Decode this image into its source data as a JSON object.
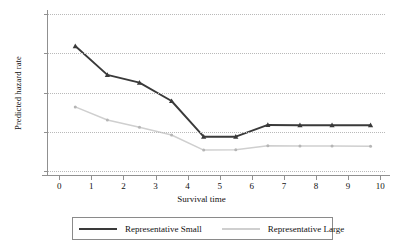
{
  "chart_data": {
    "type": "line",
    "title": "",
    "xlabel": "Survival time",
    "ylabel": "Predicted hazard rate",
    "xlim": [
      -0.35,
      10.15
    ],
    "ylim": [
      0,
      0.12
    ],
    "grid": true,
    "legend_position": "bottom",
    "xticks": [
      "0",
      "1",
      "2",
      "3",
      "4",
      "5",
      "6",
      "7",
      "8",
      "9",
      "10"
    ],
    "xtick_values": [
      0,
      1,
      2,
      3,
      4,
      5,
      6,
      7,
      8,
      9,
      10
    ],
    "yticks": [
      "",
      ".03",
      ".06",
      ".09",
      ".12"
    ],
    "ytick_values": [
      0,
      0.03,
      0.06,
      0.09,
      0.12
    ],
    "x": [
      0.5,
      1.5,
      2.5,
      3.5,
      4.5,
      5.5,
      6.5,
      7.5,
      8.5,
      9.7
    ],
    "series": [
      {
        "name": "Representative Small",
        "color": "#3a3a3a",
        "marker": "triangle",
        "values": [
          0.0955,
          0.0735,
          0.0675,
          0.0535,
          0.0262,
          0.0262,
          0.0352,
          0.035,
          0.035,
          0.035
        ]
      },
      {
        "name": "Representative Large",
        "color": "#cfcfcf",
        "marker": "dot",
        "values": [
          0.049,
          0.039,
          0.0335,
          0.0275,
          0.016,
          0.0162,
          0.0193,
          0.0191,
          0.0191,
          0.019
        ]
      }
    ]
  },
  "legend": {
    "entries": [
      {
        "label": "Representative Small"
      },
      {
        "label": "Representative Large"
      }
    ]
  },
  "colors": {
    "small_line": "#3a3a3a",
    "large_line": "#cfcfcf",
    "grid": "#b9b9b9",
    "axis": "#909090",
    "text": "#111111"
  }
}
